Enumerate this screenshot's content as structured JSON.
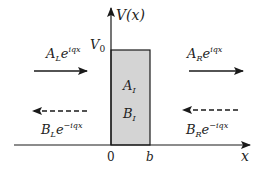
{
  "diagram": {
    "y_axis_label": "V(x)",
    "x_axis_label": "x",
    "barrier_height_label": "V",
    "barrier_height_sub": "0",
    "x_ticks": [
      "0",
      "b"
    ],
    "regions": {
      "left": {
        "incident": {
          "coef": "A",
          "sub": "L",
          "exp": "iqx",
          "direction": "right",
          "style": "solid"
        },
        "reflected": {
          "coef": "B",
          "sub": "L",
          "exp": "−iqx",
          "direction": "left",
          "style": "dashed"
        }
      },
      "inside": {
        "a": {
          "coef": "A",
          "sub": "I"
        },
        "b": {
          "coef": "B",
          "sub": "I"
        }
      },
      "right": {
        "transmitted": {
          "coef": "A",
          "sub": "R",
          "exp": "iqx",
          "direction": "right",
          "style": "solid"
        },
        "incoming": {
          "coef": "B",
          "sub": "R",
          "exp": "−iqx",
          "direction": "left",
          "style": "dashed"
        }
      }
    },
    "colors": {
      "barrier_fill": "#d4d4d4",
      "lines": "#1a1a1a"
    }
  }
}
